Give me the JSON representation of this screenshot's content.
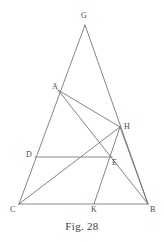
{
  "figure": {
    "caption": "Fig. 28",
    "stroke_color": "#6e6e6e",
    "label_color": "#4a4a4a",
    "background_color": "#ffffff",
    "points": [
      {
        "id": "G",
        "label": "G",
        "x": 85,
        "y": 25,
        "label_x": 81,
        "label_y": 12
      },
      {
        "id": "A",
        "label": "A",
        "x": 58,
        "y": 90,
        "label_x": 52,
        "label_y": 83
      },
      {
        "id": "H",
        "label": "H",
        "x": 120,
        "y": 127,
        "label_x": 124,
        "label_y": 123
      },
      {
        "id": "D",
        "label": "D",
        "x": 35,
        "y": 157,
        "label_x": 26,
        "label_y": 151
      },
      {
        "id": "E",
        "label": "E",
        "x": 112,
        "y": 157,
        "label_x": 112,
        "label_y": 159
      },
      {
        "id": "C",
        "label": "C",
        "x": 19,
        "y": 204,
        "label_x": 10,
        "label_y": 206
      },
      {
        "id": "K",
        "label": "K",
        "x": 94,
        "y": 204,
        "label_x": 91,
        "label_y": 206
      },
      {
        "id": "B",
        "label": "B",
        "x": 148,
        "y": 204,
        "label_x": 150,
        "label_y": 206
      }
    ],
    "segments": [
      {
        "name": "segment-C-G",
        "from": "C",
        "to": "G",
        "style": "normal"
      },
      {
        "name": "segment-G-B",
        "from": "G",
        "to": "B",
        "style": "normal"
      },
      {
        "name": "segment-C-B",
        "from": "C",
        "to": "B",
        "style": "baseline"
      },
      {
        "name": "segment-C-H",
        "from": "C",
        "to": "H",
        "style": "normal"
      },
      {
        "name": "segment-A-H",
        "from": "A",
        "to": "H",
        "style": "normal"
      },
      {
        "name": "segment-H-B",
        "from": "H",
        "to": "B",
        "style": "normal"
      },
      {
        "name": "segment-H-K",
        "from": "H",
        "to": "K",
        "style": "normal"
      },
      {
        "name": "segment-D-E",
        "from": "D",
        "to": "E",
        "style": "baseline"
      },
      {
        "name": "segment-A-B",
        "from": "A",
        "to": "B",
        "style": "normal"
      }
    ]
  }
}
